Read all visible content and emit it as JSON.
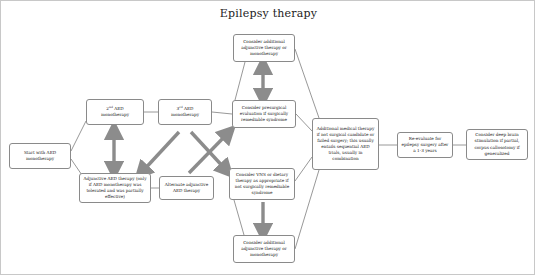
{
  "title": "Epilepsy therapy",
  "diagram": {
    "type": "flowchart",
    "colors": {
      "box_border": "#8a8a8a",
      "thin_connector": "#7a7a7a",
      "thick_arrow": "#808080",
      "text": "#1a1a1a",
      "canvas_border": "#c8c8c8"
    },
    "nodes": [
      {
        "id": "start",
        "label": "Start with AED monotherapy",
        "x": 8,
        "y": 142,
        "w": 62,
        "h": 26
      },
      {
        "id": "second_aed",
        "label": "2nd AED monotherapy",
        "label_html": "2<sup>nd</sup> AED<br>monotherapy",
        "x": 85,
        "y": 98,
        "w": 58,
        "h": 26
      },
      {
        "id": "third_aed",
        "label": "3rd AED monotherapy",
        "label_html": "3<sup>rd</sup> AED<br>monotherapy",
        "x": 157,
        "y": 98,
        "w": 54,
        "h": 26
      },
      {
        "id": "adjunctive",
        "label": "Adjunctive AED therapy (only if AED monotherapy was tolerated and was partially effective)",
        "x": 78,
        "y": 172,
        "w": 72,
        "h": 30
      },
      {
        "id": "alternate",
        "label": "Alternate adjunctive AED therapy",
        "x": 158,
        "y": 175,
        "w": 55,
        "h": 24
      },
      {
        "id": "consider_top",
        "label": "Consider additional adjunctive therapy or monotherapy",
        "x": 232,
        "y": 33,
        "w": 62,
        "h": 28
      },
      {
        "id": "presurgical",
        "label": "Consider presurgical evaluation if surgically remediable syndrome",
        "x": 231,
        "y": 99,
        "w": 64,
        "h": 28
      },
      {
        "id": "vns",
        "label": "Consider VNS or dietary therapy as appropriate if not surgically remediable syndrome",
        "x": 228,
        "y": 167,
        "w": 66,
        "h": 32
      },
      {
        "id": "consider_bottom",
        "label": "Consider additional adjunctive therapy or monotherapy",
        "x": 232,
        "y": 234,
        "w": 62,
        "h": 28
      },
      {
        "id": "additional_medical",
        "label": "Additional medical therapy if not surgical candidate or failed surgery; this usually entails sequential AED trials, usually in combination",
        "x": 311,
        "y": 117,
        "w": 67,
        "h": 52
      },
      {
        "id": "reevaluate",
        "label": "Re-evaluate for epilepsy surgery after a 1-3 years",
        "x": 396,
        "y": 131,
        "w": 56,
        "h": 26
      },
      {
        "id": "deep_brain",
        "label": "Consider deep brain stimulation if partial, corpus callosotomy if generalized",
        "x": 465,
        "y": 128,
        "w": 62,
        "h": 31
      }
    ],
    "thin_connectors": [
      {
        "name": "start-to-second",
        "from": "start",
        "to": "second_aed",
        "d": "M70,150 L85,120"
      },
      {
        "name": "start-to-adjunctive",
        "from": "start",
        "to": "adjunctive",
        "d": "M70,158 L85,180"
      },
      {
        "name": "second-to-third",
        "from": "second_aed",
        "to": "third_aed",
        "d": "M143,111 L157,111"
      },
      {
        "name": "third-to-presurgical",
        "from": "third_aed",
        "to": "presurgical",
        "d": "M211,111 L231,113"
      },
      {
        "name": "adjunctive-to-alternate",
        "from": "adjunctive",
        "to": "alternate",
        "d": "M150,187 L158,187"
      },
      {
        "name": "presurgical-to-considertop",
        "from": "presurgical",
        "to": "consider_top",
        "d": "M234,99 L244,61"
      },
      {
        "name": "considertop-to-additional",
        "from": "consider_top",
        "to": "additional_medical",
        "d": "M294,48 L318,117"
      },
      {
        "name": "presurgical-to-additional",
        "from": "presurgical",
        "to": "additional_medical",
        "d": "M295,113 L311,130"
      },
      {
        "name": "vns-to-additional",
        "from": "vns",
        "to": "additional_medical",
        "d": "M294,180 L311,156"
      },
      {
        "name": "considerbottom-to-additional",
        "from": "consider_bottom",
        "to": "additional_medical",
        "d": "M294,248 L318,169"
      },
      {
        "name": "vns-to-considerbottom",
        "from": "vns",
        "to": "consider_bottom",
        "d": "M233,199 L243,234"
      },
      {
        "name": "additional-to-reevaluate",
        "from": "additional_medical",
        "to": "reevaluate",
        "d": "M378,144 L396,144"
      },
      {
        "name": "reevaluate-to-deepbrain",
        "from": "reevaluate",
        "to": "deep_brain",
        "d": "M452,144 L465,144"
      }
    ],
    "thick_arrows": [
      {
        "name": "second-adjunctive-double",
        "kind": "double-vertical",
        "x": 113,
        "y1": 129,
        "y2": 170
      },
      {
        "name": "presurgical-considertop-double",
        "kind": "double-vertical",
        "x": 262,
        "y1": 64,
        "y2": 97
      },
      {
        "name": "vns-considerbottom-down",
        "kind": "single-down",
        "x": 262,
        "y1": 201,
        "y2": 232
      },
      {
        "name": "third-to-adjunctive-diagonal",
        "kind": "single-diagonal",
        "x1": 178,
        "y1": 131,
        "x2": 140,
        "y2": 172
      },
      {
        "name": "alternate-to-presurgical-diagonal",
        "kind": "single-diagonal",
        "x1": 188,
        "y1": 172,
        "x2": 228,
        "y2": 131
      },
      {
        "name": "third-to-vns-diagonal",
        "kind": "single-diagonal",
        "x1": 190,
        "y1": 131,
        "x2": 226,
        "y2": 170
      }
    ]
  }
}
